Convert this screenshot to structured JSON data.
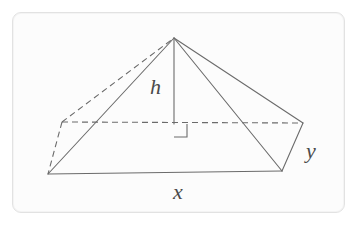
{
  "figure": {
    "labels": {
      "height": "h",
      "base_length": "x",
      "base_depth": "y"
    },
    "colors": {
      "stroke": "#6b6b6b",
      "dashed_stroke": "#6b6b6b",
      "label_text": "#4a4a4a",
      "card_background": "#fcfcfc",
      "card_border": "#e2e2e2",
      "page_background": "#ffffff"
    },
    "geometry": {
      "apex": [
        174,
        38
      ],
      "front_left": [
        48,
        174
      ],
      "front_right": [
        282,
        171
      ],
      "back_left": [
        62,
        122
      ],
      "back_right": [
        303,
        123
      ],
      "base_center": [
        174,
        124
      ],
      "right_angle_marker": {
        "x": 174,
        "y": 124,
        "size": 13
      },
      "solid_edges": [
        [
          [
            48,
            174
          ],
          [
            282,
            171
          ]
        ],
        [
          [
            48,
            174
          ],
          [
            174,
            38
          ]
        ],
        [
          [
            174,
            38
          ],
          [
            282,
            171
          ]
        ],
        [
          [
            174,
            38
          ],
          [
            303,
            123
          ]
        ],
        [
          [
            282,
            171
          ],
          [
            303,
            123
          ]
        ],
        [
          [
            174,
            38
          ],
          [
            174,
            124
          ]
        ]
      ],
      "dashed_edges": [
        [
          [
            62,
            122
          ],
          [
            303,
            123
          ]
        ],
        [
          [
            62,
            122
          ],
          [
            48,
            174
          ]
        ],
        [
          [
            62,
            122
          ],
          [
            174,
            38
          ]
        ]
      ]
    }
  }
}
